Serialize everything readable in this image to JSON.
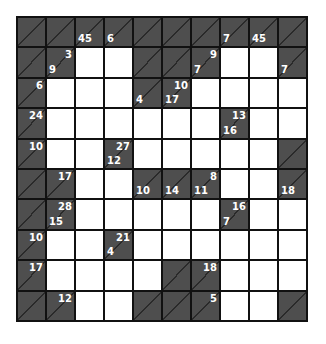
{
  "puzzle": {
    "type": "kakuro",
    "rows": 10,
    "cols": 10,
    "colors": {
      "dark_cell": "#4e4e4e",
      "white_cell": "#ffffff",
      "grid_line": "#111111",
      "clue_text": "#ffffff"
    },
    "cells": [
      [
        {
          "t": "d"
        },
        {
          "t": "d"
        },
        {
          "t": "d",
          "down": "45"
        },
        {
          "t": "d",
          "down": "6"
        },
        {
          "t": "d"
        },
        {
          "t": "d"
        },
        {
          "t": "d"
        },
        {
          "t": "d",
          "down": "7"
        },
        {
          "t": "d",
          "down": "45"
        },
        {
          "t": "d"
        }
      ],
      [
        {
          "t": "d"
        },
        {
          "t": "d",
          "right": "3",
          "down": "9"
        },
        {
          "t": "w"
        },
        {
          "t": "w"
        },
        {
          "t": "d"
        },
        {
          "t": "d"
        },
        {
          "t": "d",
          "right": "9",
          "down": "7"
        },
        {
          "t": "w"
        },
        {
          "t": "w"
        },
        {
          "t": "d",
          "down": "7"
        }
      ],
      [
        {
          "t": "d",
          "right": "6"
        },
        {
          "t": "w"
        },
        {
          "t": "w"
        },
        {
          "t": "w"
        },
        {
          "t": "d",
          "down": "4"
        },
        {
          "t": "d",
          "right": "10",
          "down": "17"
        },
        {
          "t": "w"
        },
        {
          "t": "w"
        },
        {
          "t": "w"
        },
        {
          "t": "w"
        }
      ],
      [
        {
          "t": "d",
          "right": "24"
        },
        {
          "t": "w"
        },
        {
          "t": "w"
        },
        {
          "t": "w"
        },
        {
          "t": "w"
        },
        {
          "t": "w"
        },
        {
          "t": "w"
        },
        {
          "t": "d",
          "right": "13",
          "down": "16"
        },
        {
          "t": "w"
        },
        {
          "t": "w"
        }
      ],
      [
        {
          "t": "d",
          "right": "10"
        },
        {
          "t": "w"
        },
        {
          "t": "w"
        },
        {
          "t": "d",
          "right": "27",
          "down": "12"
        },
        {
          "t": "w"
        },
        {
          "t": "w"
        },
        {
          "t": "w"
        },
        {
          "t": "w"
        },
        {
          "t": "w"
        },
        {
          "t": "d"
        }
      ],
      [
        {
          "t": "d"
        },
        {
          "t": "d",
          "right": "17"
        },
        {
          "t": "w"
        },
        {
          "t": "w"
        },
        {
          "t": "d",
          "down": "10"
        },
        {
          "t": "d",
          "down": "14"
        },
        {
          "t": "d",
          "right": "8",
          "down": "11"
        },
        {
          "t": "w"
        },
        {
          "t": "w"
        },
        {
          "t": "d",
          "down": "18"
        }
      ],
      [
        {
          "t": "d"
        },
        {
          "t": "d",
          "right": "28",
          "down": "15"
        },
        {
          "t": "w"
        },
        {
          "t": "w"
        },
        {
          "t": "w"
        },
        {
          "t": "w"
        },
        {
          "t": "w"
        },
        {
          "t": "d",
          "right": "16",
          "down": "7"
        },
        {
          "t": "w"
        },
        {
          "t": "w"
        }
      ],
      [
        {
          "t": "d",
          "right": "10"
        },
        {
          "t": "w"
        },
        {
          "t": "w"
        },
        {
          "t": "d",
          "right": "21",
          "down": "4"
        },
        {
          "t": "w"
        },
        {
          "t": "w"
        },
        {
          "t": "w"
        },
        {
          "t": "w"
        },
        {
          "t": "w"
        },
        {
          "t": "w"
        }
      ],
      [
        {
          "t": "d",
          "right": "17"
        },
        {
          "t": "w"
        },
        {
          "t": "w"
        },
        {
          "t": "w"
        },
        {
          "t": "w"
        },
        {
          "t": "d"
        },
        {
          "t": "d",
          "right": "18"
        },
        {
          "t": "w"
        },
        {
          "t": "w"
        },
        {
          "t": "w"
        }
      ],
      [
        {
          "t": "d"
        },
        {
          "t": "d",
          "right": "12"
        },
        {
          "t": "w"
        },
        {
          "t": "w"
        },
        {
          "t": "d"
        },
        {
          "t": "d"
        },
        {
          "t": "d",
          "right": "5"
        },
        {
          "t": "w"
        },
        {
          "t": "w"
        },
        {
          "t": "d"
        }
      ]
    ]
  }
}
